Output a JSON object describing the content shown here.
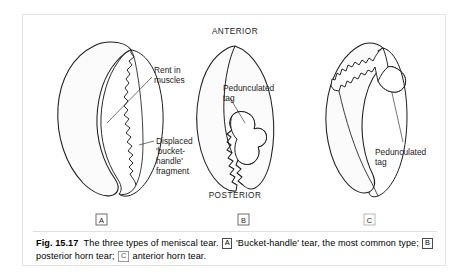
{
  "figure": {
    "orientation": {
      "anterior": "ANTERIOR",
      "posterior": "POSTERIOR"
    },
    "panels": [
      {
        "id": "A",
        "letter": "A",
        "annotations": [
          {
            "id": "rent-in-muscles",
            "lines": [
              "Rent in",
              "muscles"
            ]
          },
          {
            "id": "displaced-fragment",
            "lines": [
              "Displaced",
              "'bucket-",
              "handle'",
              "fragment"
            ]
          }
        ]
      },
      {
        "id": "B",
        "letter": "B",
        "annotations": [
          {
            "id": "pedunculated-tag-b",
            "lines": [
              "Pedunculated",
              "tag"
            ]
          }
        ]
      },
      {
        "id": "C",
        "letter": "C",
        "annotations": [
          {
            "id": "pedunculated-tag-c",
            "lines": [
              "Pedunculated",
              "tag"
            ]
          }
        ]
      }
    ],
    "caption": {
      "number": "Fig. 15.17",
      "part1": "The three types of meniscal tear.",
      "letter_a": "A",
      "part2": "'Bucket-handle' tear, the most common type;",
      "letter_b": "B",
      "part3": "posterior horn tear;",
      "letter_c": "C",
      "part4": "anterior horn tear."
    },
    "colors": {
      "line": "#1c1c1c",
      "fill": "#fbfbfb",
      "frame_border": "#e3e3e3",
      "text": "#000000"
    }
  }
}
